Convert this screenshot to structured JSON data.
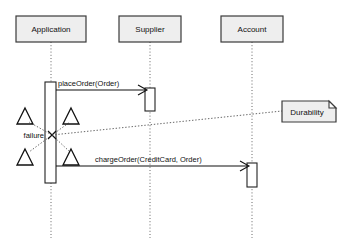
{
  "diagram": {
    "type": "uml-sequence-diagram",
    "canvas": {
      "width": 344,
      "height": 250,
      "background": "#ffffff"
    },
    "colors": {
      "box_fill": "#eeeeee",
      "box_stroke": "#3a3a3a",
      "line": "#111111",
      "dotted": "#555555",
      "activation_fill": "#ffffff"
    },
    "lifelines": [
      {
        "id": "application",
        "label": "Application",
        "box": {
          "x": 16,
          "y": 16,
          "w": 70,
          "h": 26
        },
        "axis_x": 51,
        "lifeline_bottom": 238,
        "activation": {
          "x": 45,
          "y": 82,
          "w": 11,
          "h": 101
        }
      },
      {
        "id": "supplier",
        "label": "Supplier",
        "box": {
          "x": 119,
          "y": 16,
          "w": 62,
          "h": 26
        },
        "axis_x": 150,
        "lifeline_bottom": 238,
        "activation": {
          "x": 145,
          "y": 88,
          "w": 10,
          "h": 23
        }
      },
      {
        "id": "account",
        "label": "Account",
        "box": {
          "x": 221,
          "y": 16,
          "w": 62,
          "h": 26
        },
        "axis_x": 252,
        "lifeline_bottom": 238,
        "activation": {
          "x": 247,
          "y": 163,
          "w": 10,
          "h": 24
        }
      }
    ],
    "messages": [
      {
        "id": "place-order",
        "label": "placeOrder(Order)",
        "from": "application",
        "to": "supplier",
        "y": 90,
        "x1": 56,
        "x2": 145,
        "label_x": 58,
        "label_y": 85,
        "arrow": "open"
      },
      {
        "id": "charge-order",
        "label": "chargeOrder(CreditCard, Order)",
        "from": "application",
        "to": "account",
        "y": 166,
        "x1": 56,
        "x2": 247,
        "label_x": 95,
        "label_y": 161,
        "arrow": "open"
      }
    ],
    "failure": {
      "label": "failure",
      "label_x": 40,
      "label_y": 138,
      "x": 52,
      "y": 135,
      "triangles": [
        {
          "cx": 25,
          "cy": 117,
          "size": 15
        },
        {
          "cx": 71,
          "cy": 117,
          "size": 15
        },
        {
          "cx": 25,
          "cy": 158,
          "size": 15
        },
        {
          "cx": 71,
          "cy": 158,
          "size": 15
        }
      ]
    },
    "note": {
      "id": "durability-note",
      "label": "Durability",
      "box": {
        "x": 282,
        "y": 101,
        "w": 54,
        "h": 21
      },
      "fold": 7,
      "connector": {
        "x1": 52,
        "y1": 135,
        "x2": 282,
        "y2": 111
      }
    }
  }
}
